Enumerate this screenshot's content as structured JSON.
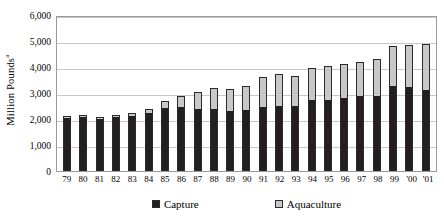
{
  "chart_data": {
    "type": "bar",
    "stacked": true,
    "title": "",
    "xlabel": "",
    "ylabel": "Million Pounds",
    "ylabel_superscript": "a",
    "ylim": [
      0,
      6000
    ],
    "ytick_values": [
      0,
      1000,
      2000,
      3000,
      4000,
      5000,
      6000
    ],
    "ytick_labels": [
      "0",
      "1,000",
      "2,000",
      "3,000",
      "4,000",
      "5,000",
      "6,000"
    ],
    "grid": true,
    "legend_position": "bottom",
    "categories": [
      "79",
      "80",
      "81",
      "82",
      "83",
      "84",
      "85",
      "86",
      "87",
      "88",
      "89",
      "90",
      "91",
      "92",
      "93",
      "94",
      "95",
      "96",
      "97",
      "98",
      "99",
      "'00",
      "'01"
    ],
    "series": [
      {
        "name": "Capture",
        "color": "#231f1e",
        "values": [
          2020,
          2080,
          1990,
          2090,
          2110,
          2250,
          2420,
          2480,
          2370,
          2400,
          2290,
          2330,
          2460,
          2500,
          2490,
          2730,
          2730,
          2820,
          2870,
          2870,
          3260,
          3220,
          3110
        ]
      },
      {
        "name": "Aquaculture",
        "color": "#c8c8c8",
        "values": [
          40,
          50,
          40,
          80,
          130,
          120,
          260,
          400,
          680,
          810,
          880,
          950,
          1160,
          1240,
          1180,
          1220,
          1310,
          1280,
          1320,
          1440,
          1530,
          1620,
          1780
        ]
      }
    ],
    "totals": [
      2060,
      2130,
      2030,
      2170,
      2240,
      2370,
      2680,
      2880,
      3050,
      3210,
      3170,
      3280,
      3620,
      3740,
      3670,
      3950,
      4040,
      4100,
      4190,
      4310,
      4790,
      4840,
      4890
    ]
  },
  "legend": {
    "items": [
      {
        "label": "Capture",
        "swatch": "black-square-icon"
      },
      {
        "label": "Aquaculture",
        "swatch": "gray-square-icon"
      }
    ]
  }
}
